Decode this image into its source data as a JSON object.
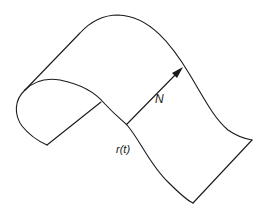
{
  "diagram": {
    "labels": {
      "normal": "N",
      "curve": "r(t)"
    },
    "colors": {
      "stroke": "#1a1a1a",
      "background": "#ffffff"
    }
  }
}
